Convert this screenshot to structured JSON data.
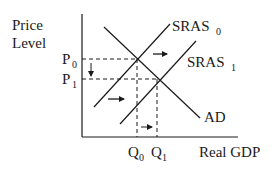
{
  "diagram": {
    "type": "AS-AD shift diagram",
    "y_axis_label_line1": "Price",
    "y_axis_label_line2": "Level",
    "x_axis_label": "Real GDP",
    "price_labels": [
      {
        "base": "P",
        "sub": "0"
      },
      {
        "base": "P",
        "sub": "1"
      }
    ],
    "quantity_labels": [
      {
        "base": "Q",
        "sub": "0"
      },
      {
        "base": "Q",
        "sub": "1"
      }
    ],
    "curves": [
      {
        "name": "SRAS0",
        "base": "SRAS",
        "sub": "0"
      },
      {
        "name": "SRAS1",
        "base": "SRAS",
        "sub": "1"
      },
      {
        "name": "AD",
        "base": "AD",
        "sub": ""
      }
    ],
    "annotations": [
      "SRAS shifts right (arrows)",
      "Price level falls from P0 to P1",
      "Real GDP rises from Q0 to Q1"
    ],
    "colors": {
      "line": "#1a1a1a",
      "background": "#ffffff"
    }
  }
}
